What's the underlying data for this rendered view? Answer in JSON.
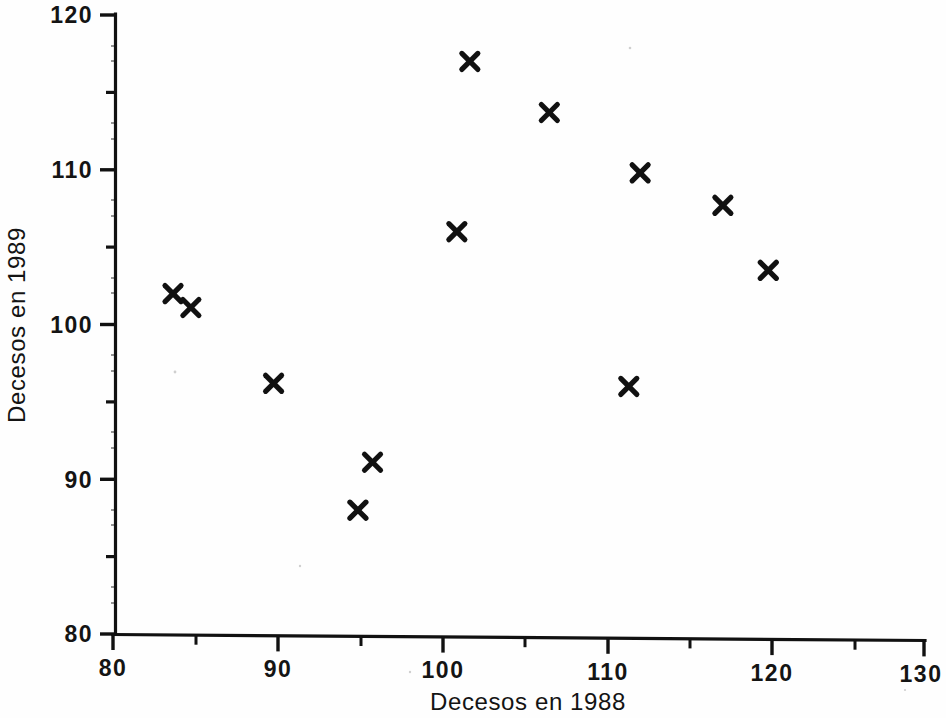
{
  "chart_data": {
    "type": "scatter",
    "title": "",
    "subtitle": "",
    "xlabel": "Decesos en 1988",
    "ylabel": "Decesos en 1989",
    "xlim": [
      80,
      130
    ],
    "ylim": [
      80,
      120
    ],
    "x_major_ticks": [
      80,
      90,
      100,
      110,
      120,
      130
    ],
    "x_major_tick_labels": [
      "80",
      "90",
      "100",
      "110",
      "120",
      "130"
    ],
    "x_minor_ticks": [
      85,
      95,
      105,
      115,
      125
    ],
    "y_major_ticks": [
      80,
      90,
      100,
      110,
      120
    ],
    "y_major_tick_labels": [
      "80",
      "90",
      "100",
      "110",
      "120"
    ],
    "y_minor_ticks": [
      85,
      95,
      105,
      115
    ],
    "grid": false,
    "legend": null,
    "legend_position": "none",
    "marker_style": "x",
    "marker_color": "#111111",
    "series": [
      {
        "name": "Decesos",
        "points": [
          {
            "x": 83.7,
            "y": 102.0
          },
          {
            "x": 84.8,
            "y": 101.1
          },
          {
            "x": 89.9,
            "y": 96.2
          },
          {
            "x": 95.1,
            "y": 88.0
          },
          {
            "x": 96.0,
            "y": 91.1
          },
          {
            "x": 101.2,
            "y": 106.0
          },
          {
            "x": 102.0,
            "y": 117.0
          },
          {
            "x": 106.9,
            "y": 113.7
          },
          {
            "x": 111.8,
            "y": 96.0
          },
          {
            "x": 112.5,
            "y": 109.8
          },
          {
            "x": 117.6,
            "y": 107.7
          },
          {
            "x": 120.4,
            "y": 103.5
          }
        ]
      }
    ]
  },
  "figure": {
    "background_color": "#fefefe",
    "axis_color": "#111111"
  }
}
